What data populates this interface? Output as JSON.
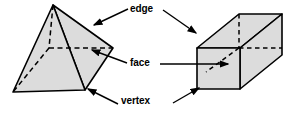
{
  "diagram": {
    "background_color": "#ffffff",
    "stroke_color": "#000000",
    "fill_color": "#dcdcdc",
    "labels": {
      "edge": "edge",
      "face": "face",
      "vertex": "vertex"
    },
    "shapes": [
      {
        "name": "square-pyramid",
        "position": "left",
        "faces": 5,
        "edges": 8,
        "vertices": 5
      },
      {
        "name": "rectangular-prism",
        "position": "right",
        "faces": 6,
        "edges": 12,
        "vertices": 8
      }
    ],
    "annotations": [
      {
        "label": "edge",
        "points_to": [
          "square-pyramid",
          "rectangular-prism"
        ]
      },
      {
        "label": "face",
        "points_to": [
          "square-pyramid",
          "rectangular-prism"
        ]
      },
      {
        "label": "vertex",
        "points_to": [
          "square-pyramid",
          "rectangular-prism"
        ]
      }
    ]
  }
}
